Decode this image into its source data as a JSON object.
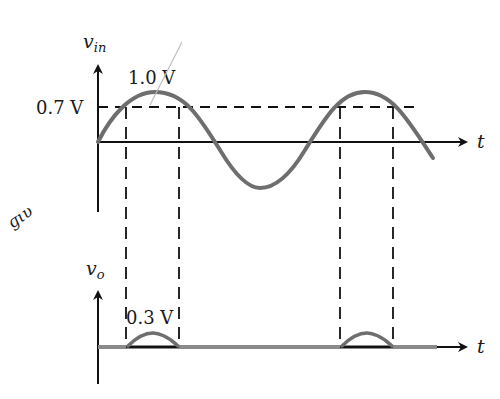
{
  "diagram": {
    "top_plot": {
      "y_label": "v",
      "y_label_sub": "in",
      "x_label": "t",
      "peak_label": "1.0 V",
      "threshold_label": "0.7 V"
    },
    "bottom_plot": {
      "y_label": "v",
      "y_label_sub": "o",
      "x_label": "t",
      "pulse_label": "0.3 V"
    },
    "handwriting": "ɡιυ",
    "colors": {
      "axis": "#111111",
      "waveform": "#6e6e6e",
      "dashed": "#111111",
      "annotation": "#bdbdbd"
    }
  }
}
